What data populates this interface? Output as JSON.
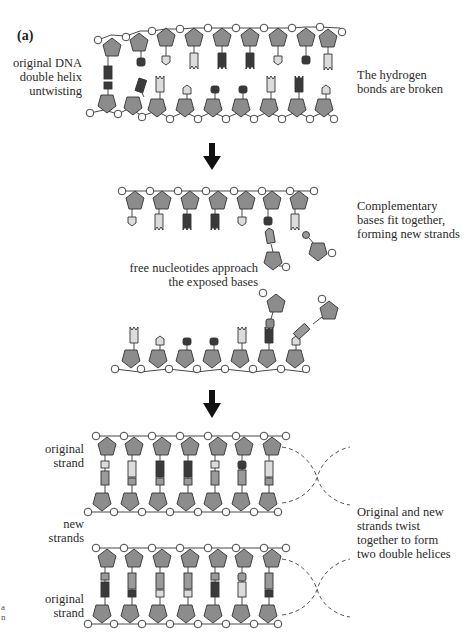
{
  "figure": {
    "panel_label": "(a)",
    "colors": {
      "sugar": "#8c8c8c",
      "phosphate": "#ffffff",
      "base_dark": "#3a3a3a",
      "base_light": "#dcdcdc",
      "base_mid": "#9a9a9a",
      "arrow": "#111111",
      "dashed_line": "#555555"
    },
    "steps": [
      {
        "id": "untwisting",
        "left_label": [
          "original DNA",
          "double helix",
          "untwisting"
        ],
        "right_label": [
          "The hydrogen",
          "bonds are broken"
        ]
      },
      {
        "id": "complementary",
        "right_label": [
          "Complementary",
          "bases fit together,",
          "forming new strands"
        ],
        "center_label": [
          "free nucleotides approach",
          "the exposed bases"
        ]
      },
      {
        "id": "twist",
        "left_labels": [
          [
            "original",
            "strand"
          ],
          [
            "new",
            "strands"
          ],
          [
            "original",
            "strand"
          ]
        ],
        "right_label": [
          "Original and new",
          "strands twist",
          "together to form",
          "two double helices"
        ]
      }
    ],
    "edge_fragment": [
      "a",
      "n"
    ]
  }
}
